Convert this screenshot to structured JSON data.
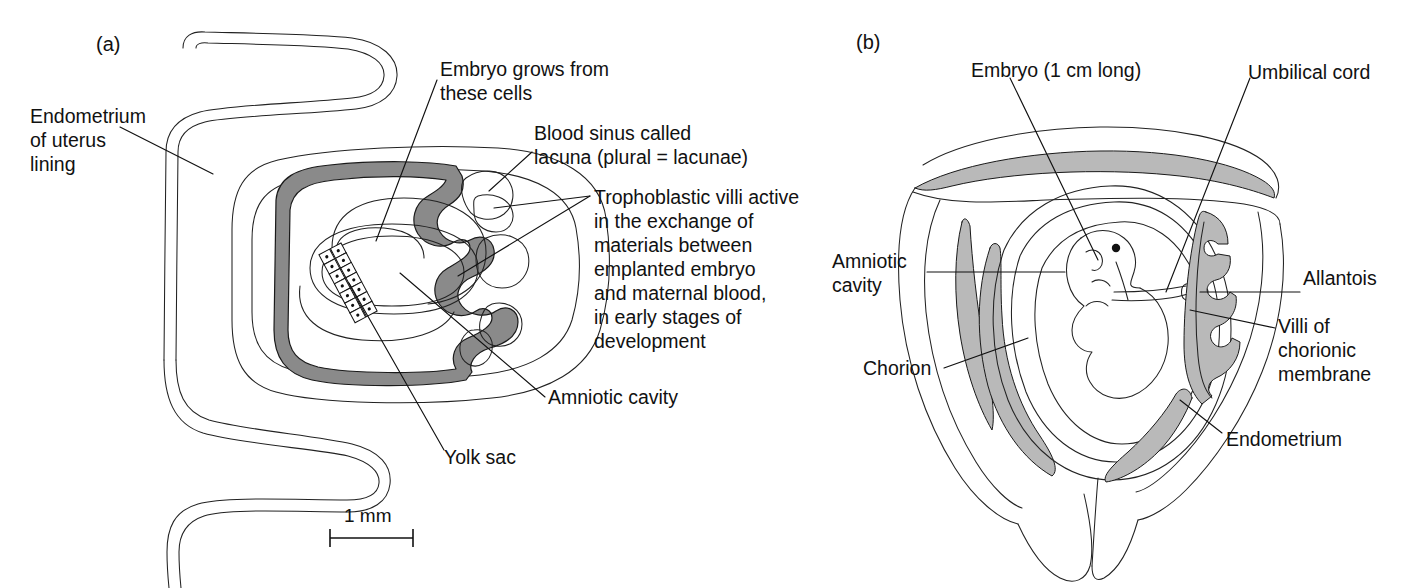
{
  "figure": {
    "type": "biological-diagram",
    "background": "#ffffff",
    "ink": "#111111",
    "shade_troph": "#8a8a8a",
    "shade_endometrium": "#b9b9b9"
  },
  "panel_a": {
    "tag": "(a)",
    "scale_bar": {
      "label": "1 mm"
    },
    "labels": {
      "endometrium": "Endometrium\nof uterus\nlining",
      "endometrium_lines": [
        "Endometrium",
        "of uterus",
        "lining"
      ],
      "embryo_cells": "Embryo grows from\nthese cells",
      "embryo_cells_lines": [
        "Embryo grows from",
        "these cells"
      ],
      "lacuna": "Blood sinus called\nlacuna (plural = lacunae)",
      "lacuna_lines": [
        "Blood sinus called",
        "lacuna (plural = lacunae)"
      ],
      "trophoblast": "Trophoblastic villi active\nin the exchange of\nmaterials between\nemplanted embryo\nand maternal blood,\nin early stages of\ndevelopment",
      "trophoblast_lines": [
        "Trophoblastic villi active",
        "in the exchange of",
        "materials between",
        "emplanted embryo",
        "and maternal blood,",
        "in early stages of",
        "development"
      ],
      "amniotic_cavity": "Amniotic cavity",
      "yolk_sac": "Yolk sac"
    }
  },
  "panel_b": {
    "tag": "(b)",
    "labels": {
      "embryo": "Embryo (1 cm long)",
      "umbilical_cord": "Umbilical cord",
      "amniotic_cavity": "Amniotic\ncavity",
      "amniotic_cavity_lines": [
        "Amniotic",
        "cavity"
      ],
      "allantois": "Allantois",
      "villi": "Villi of\nchorionic\nmembrane",
      "villi_lines": [
        "Villi of",
        "chorionic",
        "membrane"
      ],
      "chorion": "Chorion",
      "endometrium": "Endometrium"
    }
  }
}
